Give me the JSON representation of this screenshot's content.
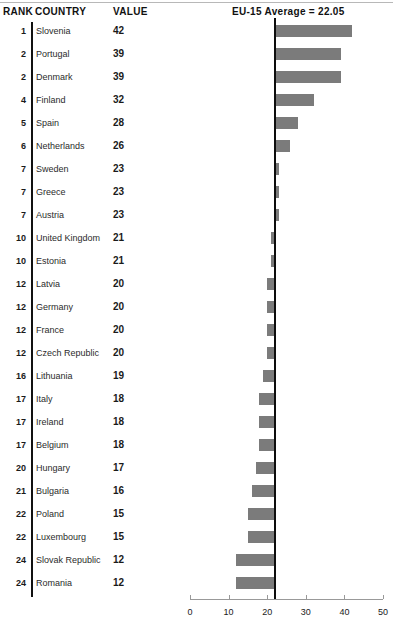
{
  "header": {
    "rank_label": "RANK",
    "country_label": "COUNTRY",
    "value_label": "VALUE",
    "average_label": "EU-15 Average = 22.05"
  },
  "chart_data": {
    "type": "bar",
    "orientation": "horizontal",
    "title": "EU-15 Average = 22.05",
    "xlabel": "",
    "ylabel": "",
    "xlim": [
      0,
      50
    ],
    "xticks": [
      0,
      10,
      20,
      30,
      40,
      50
    ],
    "xticklabels": [
      "0",
      "10",
      "20",
      "30",
      "40",
      "50"
    ],
    "grid": false,
    "legend": null,
    "reference_line": {
      "label": "EU-15 Average = 22.05",
      "value": 22.05
    },
    "bar_color": "#7b7b7b",
    "reference_line_color": "#0d0d0d",
    "categories": [
      "Slovenia",
      "Portugal",
      "Denmark",
      "Finland",
      "Spain",
      "Netherlands",
      "Sweden",
      "Greece",
      "Austria",
      "United Kingdom",
      "Estonia",
      "Latvia",
      "Germany",
      "France",
      "Czech Republic",
      "Lithuania",
      "Italy",
      "Ireland",
      "Belgium",
      "Hungary",
      "Bulgaria",
      "Poland",
      "Luxembourg",
      "Slovak Republic",
      "Romania"
    ],
    "values": [
      42,
      39,
      39,
      32,
      28,
      26,
      23,
      23,
      23,
      21,
      21,
      20,
      20,
      20,
      20,
      19,
      18,
      18,
      18,
      17,
      16,
      15,
      15,
      12,
      12
    ],
    "ranks": [
      1,
      2,
      2,
      4,
      5,
      6,
      7,
      7,
      7,
      10,
      10,
      12,
      12,
      12,
      12,
      16,
      17,
      17,
      17,
      20,
      21,
      22,
      22,
      24,
      24
    ]
  },
  "rows": [
    {
      "rank": "1",
      "country": "Slovenia",
      "value": "42"
    },
    {
      "rank": "2",
      "country": "Portugal",
      "value": "39"
    },
    {
      "rank": "2",
      "country": "Denmark",
      "value": "39"
    },
    {
      "rank": "4",
      "country": "Finland",
      "value": "32"
    },
    {
      "rank": "5",
      "country": "Spain",
      "value": "28"
    },
    {
      "rank": "6",
      "country": "Netherlands",
      "value": "26"
    },
    {
      "rank": "7",
      "country": "Sweden",
      "value": "23"
    },
    {
      "rank": "7",
      "country": "Greece",
      "value": "23"
    },
    {
      "rank": "7",
      "country": "Austria",
      "value": "23"
    },
    {
      "rank": "10",
      "country": "United Kingdom",
      "value": "21"
    },
    {
      "rank": "10",
      "country": "Estonia",
      "value": "21"
    },
    {
      "rank": "12",
      "country": "Latvia",
      "value": "20"
    },
    {
      "rank": "12",
      "country": "Germany",
      "value": "20"
    },
    {
      "rank": "12",
      "country": "France",
      "value": "20"
    },
    {
      "rank": "12",
      "country": "Czech Republic",
      "value": "20"
    },
    {
      "rank": "16",
      "country": "Lithuania",
      "value": "19"
    },
    {
      "rank": "17",
      "country": "Italy",
      "value": "18"
    },
    {
      "rank": "17",
      "country": "Ireland",
      "value": "18"
    },
    {
      "rank": "17",
      "country": "Belgium",
      "value": "18"
    },
    {
      "rank": "20",
      "country": "Hungary",
      "value": "17"
    },
    {
      "rank": "21",
      "country": "Bulgaria",
      "value": "16"
    },
    {
      "rank": "22",
      "country": "Poland",
      "value": "15"
    },
    {
      "rank": "22",
      "country": "Luxembourg",
      "value": "15"
    },
    {
      "rank": "24",
      "country": "Slovak Republic",
      "value": "12"
    },
    {
      "rank": "24",
      "country": "Romania",
      "value": "12"
    }
  ]
}
